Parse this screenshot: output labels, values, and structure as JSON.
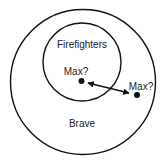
{
  "diagram": {
    "type": "euler",
    "sets": [
      {
        "label": "Brave",
        "role": "outer"
      },
      {
        "label": "Firefighters",
        "role": "inner"
      }
    ],
    "points": [
      {
        "label": "Max?",
        "position": "inside-firefighters"
      },
      {
        "label": "Max?",
        "position": "brave-only"
      }
    ],
    "connector": "double-headed-arrow",
    "colors": {
      "stroke": "#111111",
      "background": "#ffffff"
    }
  }
}
